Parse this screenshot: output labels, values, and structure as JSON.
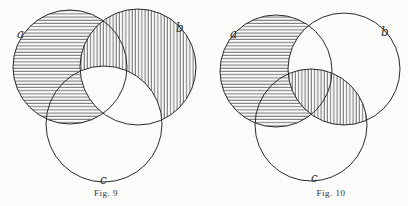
{
  "figures": [
    {
      "id": "fig9",
      "caption": "Fig. 9",
      "labels": {
        "a": "a",
        "b": "b",
        "c": "c"
      },
      "shading": {
        "horizontal": "a not b",
        "vertical": "b not c",
        "blank": "a and b and c; c not (a or b)"
      }
    },
    {
      "id": "fig10",
      "caption": "Fig. 10",
      "labels": {
        "a": "a",
        "b": "b",
        "c": "c"
      },
      "shading": {
        "horizontal": "a not b",
        "vertical": "b and c",
        "blank": "a and b not c; b not (a or c); c not (a or b)"
      }
    }
  ],
  "colors": {
    "ink": "#2a2a2a",
    "paper": "#fbfbf9"
  }
}
